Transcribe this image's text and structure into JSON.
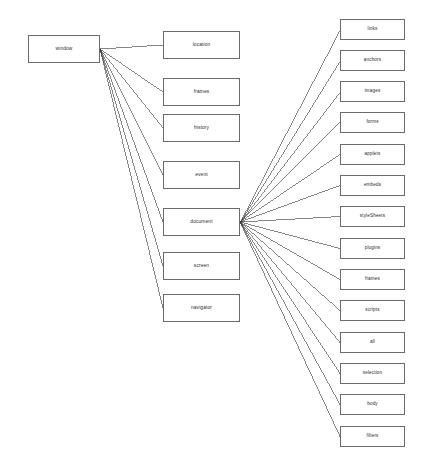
{
  "diagram": {
    "type": "tree-diagram",
    "background_color": "#ffffff",
    "box_border_color": "#6b6b6b",
    "edge_color": "#333333",
    "text_color": "#2a2a2a",
    "root": {
      "id": "window",
      "label": "window",
      "x": 28,
      "y": 35,
      "width": 72,
      "height": 28
    },
    "middle_column": {
      "x": 163,
      "width": 77,
      "height": 28,
      "pitch": 47,
      "first_y": 31,
      "items": [
        {
          "id": "location",
          "label": "location",
          "y": 31
        },
        {
          "id": "frames",
          "label": "frames",
          "y": 78
        },
        {
          "id": "history",
          "label": "history",
          "y": 114
        },
        {
          "id": "event",
          "label": "event",
          "y": 161
        },
        {
          "id": "document",
          "label": "document",
          "y": 208
        },
        {
          "id": "screen",
          "label": "screen",
          "y": 252
        },
        {
          "id": "navigator",
          "label": "navigator",
          "y": 294
        }
      ]
    },
    "right_column": {
      "x": 340,
      "width": 65,
      "height": 21,
      "pitch": 31.2,
      "first_y": 19,
      "items": [
        {
          "id": "links",
          "label": "links",
          "y": 19
        },
        {
          "id": "anchors",
          "label": "anchors",
          "y": 50
        },
        {
          "id": "images",
          "label": "images",
          "y": 81
        },
        {
          "id": "forms",
          "label": "forms",
          "y": 112
        },
        {
          "id": "applets",
          "label": "applets",
          "y": 144
        },
        {
          "id": "embeds",
          "label": "embeds",
          "y": 175
        },
        {
          "id": "styleSheets",
          "label": "styleSheets",
          "y": 206
        },
        {
          "id": "plugins",
          "label": "plugins",
          "y": 238
        },
        {
          "id": "frames_doc",
          "label": "frames",
          "y": 269
        },
        {
          "id": "scripts",
          "label": "scripts",
          "y": 300
        },
        {
          "id": "all",
          "label": "all",
          "y": 332
        },
        {
          "id": "selection",
          "label": "selection",
          "y": 363
        },
        {
          "id": "body",
          "label": "body",
          "y": 394
        },
        {
          "id": "filters",
          "label": "filters",
          "y": 426
        }
      ]
    },
    "edges": {
      "window_fan_origin": {
        "x": 100,
        "y": 49
      },
      "document_fan_origin": {
        "x": 240,
        "y": 222
      },
      "window_targets": [
        "location",
        "frames",
        "history",
        "event",
        "document",
        "screen",
        "navigator"
      ],
      "document_targets": [
        "links",
        "anchors",
        "images",
        "forms",
        "applets",
        "embeds",
        "styleSheets",
        "plugins",
        "frames_doc",
        "scripts",
        "all",
        "selection",
        "body",
        "filters"
      ]
    }
  }
}
